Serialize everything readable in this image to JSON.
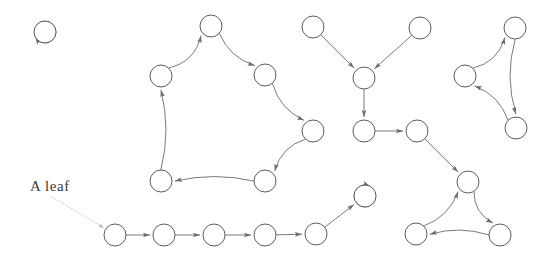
{
  "diagram": {
    "width": 543,
    "height": 259,
    "background_color": "#ffffff",
    "node_stroke_color": "#4a4a4a",
    "node_fill_color": "#ffffff",
    "edge_color": "#6b6b6b",
    "annotation_color": "#3b3b3b",
    "leader_color": "#b5b5b5",
    "node_radius": 11
  },
  "annotations": [
    {
      "name": "a-leaf-label",
      "text": "A leaf",
      "x": 30,
      "y": 191,
      "target_x": 104,
      "target_y": 228
    }
  ],
  "nodes": [
    {
      "id": "n0",
      "x": 45,
      "y": 32,
      "group": "self-loop-pair"
    },
    {
      "id": "n1",
      "x": 211,
      "y": 26,
      "group": "left-cycle"
    },
    {
      "id": "n2",
      "x": 265,
      "y": 75,
      "group": "left-cycle"
    },
    {
      "id": "n3",
      "x": 313,
      "y": 131,
      "group": "left-cycle"
    },
    {
      "id": "n4",
      "x": 265,
      "y": 181,
      "group": "left-cycle"
    },
    {
      "id": "n5",
      "x": 161,
      "y": 181,
      "group": "left-cycle"
    },
    {
      "id": "n6",
      "x": 161,
      "y": 76,
      "group": "left-cycle"
    },
    {
      "id": "n7",
      "x": 313,
      "y": 27,
      "group": "middle-fan"
    },
    {
      "id": "n8",
      "x": 420,
      "y": 28,
      "group": "middle-fan"
    },
    {
      "id": "n9",
      "x": 364,
      "y": 78,
      "group": "middle-fan"
    },
    {
      "id": "n10",
      "x": 364,
      "y": 131,
      "group": "middle-fan"
    },
    {
      "id": "n11",
      "x": 417,
      "y": 131,
      "group": "middle-fan"
    },
    {
      "id": "n12",
      "x": 515,
      "y": 28,
      "group": "right-cycle"
    },
    {
      "id": "n13",
      "x": 465,
      "y": 76,
      "group": "right-cycle"
    },
    {
      "id": "n14",
      "x": 516,
      "y": 128,
      "group": "right-cycle"
    },
    {
      "id": "n15",
      "x": 468,
      "y": 182,
      "group": "bottom-right-cycle"
    },
    {
      "id": "n16",
      "x": 416,
      "y": 234,
      "group": "bottom-right-cycle"
    },
    {
      "id": "n17",
      "x": 500,
      "y": 235,
      "group": "bottom-right-cycle"
    },
    {
      "id": "n18",
      "x": 365,
      "y": 196,
      "group": "chain-head"
    },
    {
      "id": "n19",
      "x": 115,
      "y": 235,
      "group": "chain"
    },
    {
      "id": "n20",
      "x": 164,
      "y": 235,
      "group": "chain"
    },
    {
      "id": "n21",
      "x": 214,
      "y": 235,
      "group": "chain"
    },
    {
      "id": "n22",
      "x": 265,
      "y": 235,
      "group": "chain"
    },
    {
      "id": "n23",
      "x": 316,
      "y": 234,
      "group": "chain"
    }
  ],
  "edges": [
    {
      "from": "n0",
      "to": "n0",
      "type": "self-loop",
      "loop_angle": 180
    },
    {
      "from": "n6",
      "to": "n1",
      "type": "curve",
      "bow": 14
    },
    {
      "from": "n1",
      "to": "n2",
      "type": "curve",
      "bow": 11
    },
    {
      "from": "n2",
      "to": "n3",
      "type": "curve",
      "bow": 11
    },
    {
      "from": "n3",
      "to": "n4",
      "type": "curve",
      "bow": 12
    },
    {
      "from": "n4",
      "to": "n5",
      "type": "curve",
      "bow": 9
    },
    {
      "from": "n5",
      "to": "n6",
      "type": "curve",
      "bow": 10
    },
    {
      "from": "n7",
      "to": "n9",
      "type": "line"
    },
    {
      "from": "n8",
      "to": "n9",
      "type": "line"
    },
    {
      "from": "n9",
      "to": "n10",
      "type": "line"
    },
    {
      "from": "n10",
      "to": "n11",
      "type": "line"
    },
    {
      "from": "n11",
      "to": "n15",
      "type": "line"
    },
    {
      "from": "n13",
      "to": "n12",
      "type": "curve",
      "bow": 13
    },
    {
      "from": "n12",
      "to": "n14",
      "type": "curve",
      "bow": 11
    },
    {
      "from": "n14",
      "to": "n13",
      "type": "curve",
      "bow": 11
    },
    {
      "from": "n16",
      "to": "n15",
      "type": "curve",
      "bow": 11
    },
    {
      "from": "n15",
      "to": "n17",
      "type": "curve",
      "bow": 11
    },
    {
      "from": "n17",
      "to": "n16",
      "type": "curve",
      "bow": 9
    },
    {
      "from": "n18",
      "to": "n18",
      "type": "self-loop",
      "loop_angle": 35
    },
    {
      "from": "n19",
      "to": "n20",
      "type": "line"
    },
    {
      "from": "n20",
      "to": "n21",
      "type": "line"
    },
    {
      "from": "n21",
      "to": "n22",
      "type": "line"
    },
    {
      "from": "n22",
      "to": "n23",
      "type": "line"
    },
    {
      "from": "n23",
      "to": "n18",
      "type": "line"
    }
  ]
}
